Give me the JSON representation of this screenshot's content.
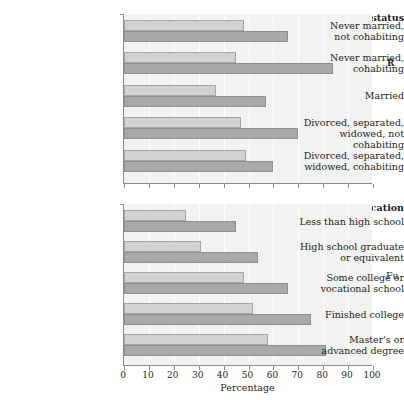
{
  "figure": {
    "axis_title": "Percentage",
    "cropped_text_fragments": {
      "right_upper": "R",
      "right_lower": "Fu",
      "top_clipped": ""
    }
  },
  "chart_data": {
    "type": "bar",
    "orientation": "horizontal",
    "title": "",
    "xlabel": "Percentage",
    "ylabel": "",
    "xlim": [
      0,
      100
    ],
    "grid": true,
    "legend": "none",
    "xticks": [
      0,
      10,
      20,
      30,
      40,
      50,
      60,
      70,
      80,
      90,
      100
    ],
    "xtick_labels": [
      "0",
      "10",
      "20",
      "30",
      "40",
      "50",
      "60",
      "70",
      "80",
      "90",
      "100"
    ],
    "colors": {
      "light_bar": "#d2d2d2",
      "dark_bar": "#a9a9a9",
      "panel_background": "#f2f2f2",
      "axis": "#8c8c8c",
      "text": "#231f20"
    },
    "panels": [
      {
        "heading": "Marital status",
        "categories": [
          "Never married,\nnot cohabiting",
          "Never married,\ncohabiting",
          "Married",
          "Divorced, separated,\nwidowed, not cohabiting",
          "Divorced, separated,\nwidowed, cohabiting"
        ],
        "series": [
          {
            "name": "light",
            "values": [
              48,
              45,
              37,
              47,
              49
            ]
          },
          {
            "name": "dark",
            "values": [
              66,
              84,
              57,
              70,
              60
            ]
          }
        ]
      },
      {
        "heading": "Education",
        "categories": [
          "Less than high school",
          "High school graduate\nor equivalent",
          "Some college or\nvocational school",
          "Finished college",
          "Master's or\nadvanced degree"
        ],
        "series": [
          {
            "name": "light",
            "values": [
              25,
              31,
              48,
              52,
              58
            ]
          },
          {
            "name": "dark",
            "values": [
              45,
              54,
              66,
              75,
              81
            ]
          }
        ]
      }
    ]
  }
}
